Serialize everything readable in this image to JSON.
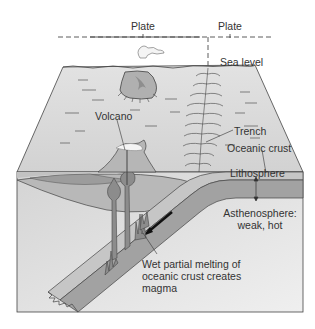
{
  "diagram": {
    "type": "cross-section",
    "labels": {
      "plate_left": "Plate",
      "plate_right": "Plate",
      "sea_level": "Sea level",
      "volcano": "Volcano",
      "trench": "Trench",
      "oceanic_crust": "Oceanic crust",
      "lithosphere": "Lithosphere",
      "asthenosphere_line1": "Asthenosphere:",
      "asthenosphere_line2": "weak, hot",
      "melting_line1": "Wet partial melting of",
      "melting_line2": "oceanic crust creates",
      "melting_line3": "magma"
    },
    "colors": {
      "surface": "#dcdcdc",
      "front_face": "#e4e4e4",
      "crust_band": "#c8c8c8",
      "lithosphere_band": "#a8a8a8",
      "slab": "#9c9c9c",
      "magma": "#8a8a8a",
      "outline": "#444444"
    },
    "features": [
      "plate boundary dashed line",
      "volcanic island with steam plume",
      "deep ocean trench",
      "subducting oceanic slab with motion arrow",
      "rising magma diapirs"
    ]
  }
}
